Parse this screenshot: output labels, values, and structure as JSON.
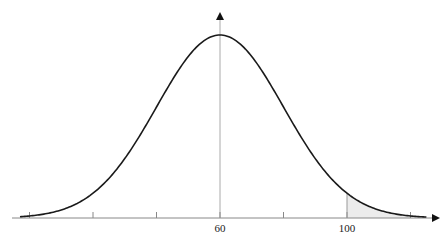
{
  "chart_data": {
    "type": "line",
    "title": "",
    "subtitle": "",
    "xlabel": "",
    "ylabel": "",
    "distribution": {
      "name": "normal",
      "mean": 60,
      "sd": 20
    },
    "x_ticks": [
      0,
      20,
      40,
      60,
      80,
      100,
      120
    ],
    "x_tick_labels": [
      {
        "value": 60,
        "label": "60"
      },
      {
        "value": 100,
        "label": "100"
      }
    ],
    "xlim": [
      -3,
      131
    ],
    "shaded_region": {
      "from": 100,
      "to": 120,
      "fill": "#ececec"
    },
    "vertical_axis_at": 60,
    "marker_line_at": 100,
    "grid": false,
    "legend": null,
    "colors": {
      "curve": "#1a1a1a",
      "axis": "#888888",
      "shade": "#ececec",
      "arrow": "#111111"
    }
  }
}
